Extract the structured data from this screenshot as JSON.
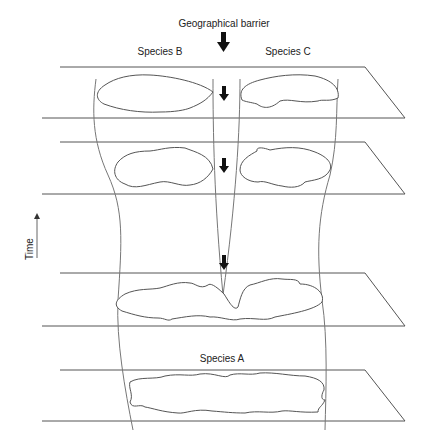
{
  "diagram": {
    "type": "allopatric speciation diagram",
    "labels": {
      "barrier": "Geographical barrier",
      "species_b": "Species B",
      "species_c": "Species C",
      "species_a": "Species A",
      "time_axis": "Time"
    },
    "planes": [
      {
        "id": "plane-1",
        "stage": "two separate species B and C"
      },
      {
        "id": "plane-2",
        "stage": "populations diverging"
      },
      {
        "id": "plane-3",
        "stage": "barrier forming, population splitting"
      },
      {
        "id": "plane-4",
        "stage": "single ancestral species A"
      }
    ],
    "arrows": [
      "barrier-arrow",
      "barrier-arrow-plane-1",
      "barrier-arrow-plane-2",
      "barrier-arrow-plane-3"
    ],
    "colors": {
      "line": "#555555",
      "lineage": "#777777",
      "arrow": "#111111",
      "text": "#222222"
    }
  }
}
